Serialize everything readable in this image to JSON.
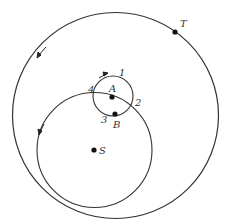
{
  "diagram": {
    "colors": {
      "stroke": "#333333",
      "dot": "#111111",
      "background": "#ffffff"
    },
    "outer_circle": {
      "cx": 115.5,
      "cy": 115.5,
      "r": 103
    },
    "inner_orbit": {
      "cx": 94.5,
      "cy": 150,
      "r": 57.5
    },
    "small_circle": {
      "cx": 113,
      "cy": 96,
      "r": 20
    },
    "points": {
      "T": {
        "label": "T",
        "x": 175,
        "y": 32
      },
      "A": {
        "label": "A",
        "x": 112,
        "y": 97
      },
      "B": {
        "label": "B",
        "x": 115,
        "y": 114
      },
      "S": {
        "label": "S",
        "x": 94,
        "y": 150
      }
    },
    "position_labels": [
      "1",
      "2",
      "3",
      "4"
    ],
    "arrows": [
      {
        "name": "outer-orbit-arrow",
        "direction": "counterclockwise"
      },
      {
        "name": "inner-orbit-arrow",
        "direction": "counterclockwise"
      },
      {
        "name": "small-circle-arrow",
        "direction": "clockwise"
      }
    ]
  }
}
